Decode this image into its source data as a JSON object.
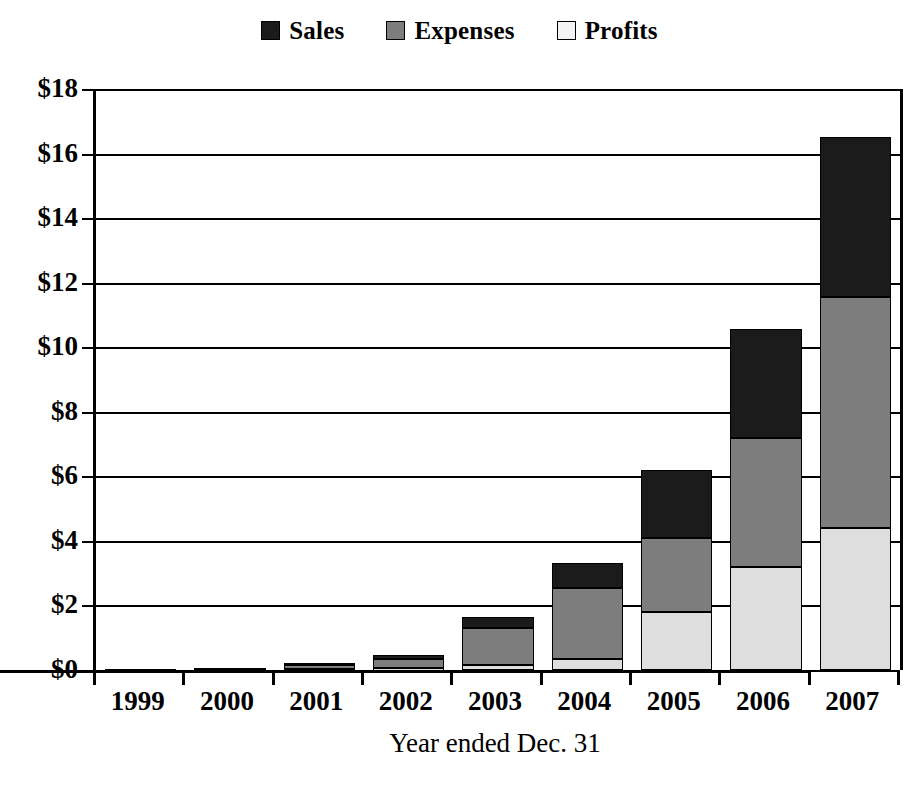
{
  "legend": {
    "position": "top-center",
    "items": [
      {
        "label": "Sales",
        "swatch": "black-square-icon",
        "color": "#1b1b1b"
      },
      {
        "label": "Expenses",
        "swatch": "gray-square-icon",
        "color": "#7d7d7d"
      },
      {
        "label": "Profits",
        "swatch": "light-gray-square-icon",
        "color": "#dedede"
      }
    ]
  },
  "axes": {
    "y_ticks": [
      "$18",
      "$16",
      "$14",
      "$12",
      "$10",
      "$8",
      "$6",
      "$4",
      "$2",
      "$0"
    ],
    "x_title": "Year ended Dec. 31"
  },
  "chart_data": {
    "type": "bar",
    "title": "",
    "subtitle": "",
    "stacked": true,
    "xlabel": "Year ended Dec. 31",
    "ylabel": "",
    "ylim": [
      0,
      18
    ],
    "ytick_step": 2,
    "ytick_prefix": "$",
    "grid": true,
    "legend_position": "top-center",
    "categories": [
      "1999",
      "2000",
      "2001",
      "2002",
      "2003",
      "2004",
      "2005",
      "2006",
      "2007"
    ],
    "series": [
      {
        "name": "Profits",
        "color": "#dedede",
        "values": [
          0.0,
          0.01,
          0.02,
          0.05,
          0.15,
          0.35,
          1.8,
          3.2,
          4.4
        ]
      },
      {
        "name": "Expenses",
        "color": "#7d7d7d",
        "values": [
          0.01,
          0.04,
          0.12,
          0.28,
          1.15,
          2.2,
          2.3,
          4.0,
          7.15
        ]
      },
      {
        "name": "Sales",
        "color": "#1b1b1b",
        "values": [
          0.01,
          0.02,
          0.08,
          0.13,
          0.34,
          0.75,
          2.1,
          3.35,
          4.95
        ]
      }
    ],
    "totals": [
      0.02,
      0.07,
      0.22,
      0.46,
      1.64,
      3.3,
      6.2,
      10.55,
      16.5
    ]
  }
}
